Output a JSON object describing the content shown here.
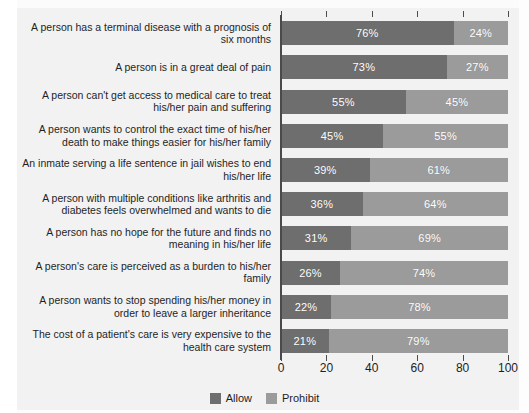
{
  "chart_data": {
    "type": "bar",
    "subtype": "stacked-horizontal-100",
    "title": "",
    "xlabel": "",
    "ylabel": "",
    "xlim": [
      0,
      100
    ],
    "xticks": [
      "0",
      "20",
      "40",
      "60",
      "80",
      "100"
    ],
    "grid": false,
    "legend_position": "bottom-center",
    "categories": [
      "A person has a terminal disease with a prognosis of six months",
      "A person is in a great deal of pain",
      "A person can't get access to medical care to treat his/her pain and suffering",
      "A person wants to control the exact time of his/her death to make things easier for his/her family",
      "An inmate serving a life sentence in jail wishes to end his/her life",
      "A person with multiple conditions like arthritis and diabetes feels overwhelmed and wants to die",
      "A person has no hope for the future and finds no meaning in his/her life",
      "A person's care is perceived as a burden to his/her family",
      "A person wants to stop spending his/her money in order to leave a larger inheritance",
      "The cost of a patient's care is very expensive to the health care system"
    ],
    "series": [
      {
        "name": "Allow",
        "color": "#6e6e6e",
        "values": [
          76,
          73,
          55,
          45,
          39,
          36,
          31,
          26,
          22,
          21
        ]
      },
      {
        "name": "Prohibit",
        "color": "#9b9b9b",
        "values": [
          24,
          27,
          45,
          55,
          61,
          64,
          69,
          74,
          78,
          79
        ]
      }
    ],
    "value_labels": [
      {
        "allow": "76%",
        "prohibit": "24%"
      },
      {
        "allow": "73%",
        "prohibit": "27%"
      },
      {
        "allow": "55%",
        "prohibit": "45%"
      },
      {
        "allow": "45%",
        "prohibit": "55%"
      },
      {
        "allow": "39%",
        "prohibit": "61%"
      },
      {
        "allow": "36%",
        "prohibit": "64%"
      },
      {
        "allow": "31%",
        "prohibit": "69%"
      },
      {
        "allow": "26%",
        "prohibit": "74%"
      },
      {
        "allow": "22%",
        "prohibit": "78%"
      },
      {
        "allow": "21%",
        "prohibit": "79%"
      }
    ]
  },
  "legend": {
    "items": [
      {
        "label": "Allow",
        "color": "#6e6e6e"
      },
      {
        "label": "Prohibit",
        "color": "#9b9b9b"
      }
    ]
  }
}
